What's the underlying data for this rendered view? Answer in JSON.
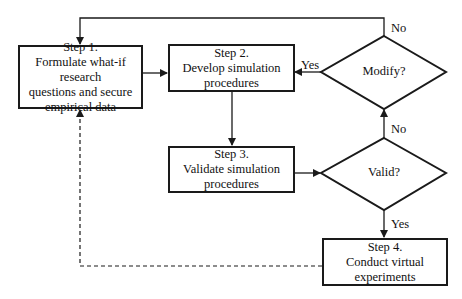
{
  "steps": [
    {
      "title": "Step 1.",
      "lines": [
        "Formulate what-if research",
        "questions and secure",
        "empirical data"
      ]
    },
    {
      "title": "Step 2.",
      "lines": [
        "Develop simulation",
        "procedures"
      ]
    },
    {
      "title": "Step 3.",
      "lines": [
        "Validate simulation",
        "procedures"
      ]
    },
    {
      "title": "Step 4.",
      "lines": [
        "Conduct virtual",
        "experiments"
      ]
    }
  ],
  "decisions": {
    "modify": "Modify?",
    "valid": "Valid?"
  },
  "labels": {
    "modify_no": "No",
    "modify_yes": "Yes",
    "valid_no": "No",
    "valid_yes": "Yes"
  },
  "colors": {
    "stroke": "#1a1a1a",
    "background": "#ffffff"
  }
}
